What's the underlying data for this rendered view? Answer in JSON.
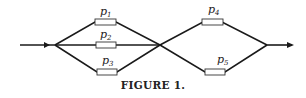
{
  "figure": {
    "caption": "FIGURE 1.",
    "nodes": [
      {
        "id": "left",
        "x": 55,
        "y": 45
      },
      {
        "id": "middle",
        "x": 160,
        "y": 45
      },
      {
        "id": "right",
        "x": 267,
        "y": 45
      }
    ],
    "components": [
      {
        "name": "p",
        "sub": "1",
        "label": "p1",
        "segment": "left-middle",
        "path": "upper"
      },
      {
        "name": "p",
        "sub": "2",
        "label": "p2",
        "segment": "left-middle",
        "path": "straight"
      },
      {
        "name": "p",
        "sub": "3",
        "label": "p3",
        "segment": "left-middle",
        "path": "lower"
      },
      {
        "name": "p",
        "sub": "4",
        "label": "p4",
        "segment": "middle-right",
        "path": "upper"
      },
      {
        "name": "p",
        "sub": "5",
        "label": "p5",
        "segment": "middle-right",
        "path": "lower"
      }
    ],
    "input_arrow": "input-arrow",
    "output_arrow": "output-arrow",
    "colors": {
      "line": "#1a1a1a",
      "box_fill": "#ffffff",
      "text": "#222222"
    }
  }
}
